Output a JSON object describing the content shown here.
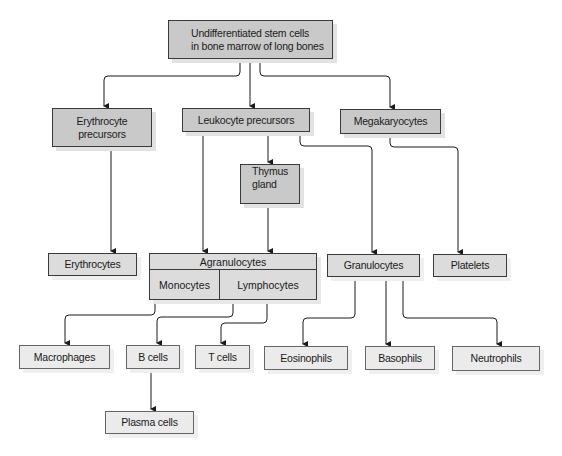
{
  "diagram": {
    "nodes": {
      "stem": "Undifferentiated stem cells\nin bone marrow of long bones",
      "stem_line1": "Undifferentiated stem cells",
      "stem_line2": "in bone marrow of long bones",
      "erythro_prec_line1": "Erythrocyte",
      "erythro_prec_line2": "precursors",
      "leuko_prec": "Leukocyte precursors",
      "megakaryocytes": "Megakaryocytes",
      "thymus_line1": "Thymus",
      "thymus_line2": "gland",
      "erythrocytes": "Erythrocytes",
      "agranulocytes": "Agranulocytes",
      "monocytes": "Monocytes",
      "lymphocytes": "Lymphocytes",
      "granulocytes": "Granulocytes",
      "platelets": "Platelets",
      "macrophages": "Macrophages",
      "b_cells": "B cells",
      "t_cells": "T cells",
      "eosinophils": "Eosinophils",
      "basophils": "Basophils",
      "neutrophils": "Neutrophils",
      "plasma_cells": "Plasma cells"
    },
    "edges": [
      [
        "Undifferentiated stem cells",
        "Erythrocyte precursors"
      ],
      [
        "Undifferentiated stem cells",
        "Leukocyte precursors"
      ],
      [
        "Undifferentiated stem cells",
        "Megakaryocytes"
      ],
      [
        "Erythrocyte precursors",
        "Erythrocytes"
      ],
      [
        "Leukocyte precursors",
        "Agranulocytes"
      ],
      [
        "Leukocyte precursors",
        "Thymus gland"
      ],
      [
        "Leukocyte precursors",
        "Granulocytes"
      ],
      [
        "Thymus gland",
        "Agranulocytes"
      ],
      [
        "Megakaryocytes",
        "Platelets"
      ],
      [
        "Monocytes",
        "Macrophages"
      ],
      [
        "Lymphocytes",
        "B cells"
      ],
      [
        "Lymphocytes",
        "T cells"
      ],
      [
        "Granulocytes",
        "Eosinophils"
      ],
      [
        "Granulocytes",
        "Basophils"
      ],
      [
        "Granulocytes",
        "Neutrophils"
      ],
      [
        "B cells",
        "Plasma cells"
      ]
    ],
    "colors": {
      "upper_box_fill": "#c9c9c9",
      "lower_box_fill": "#ebebeb",
      "line": "#1a1a1a"
    }
  }
}
